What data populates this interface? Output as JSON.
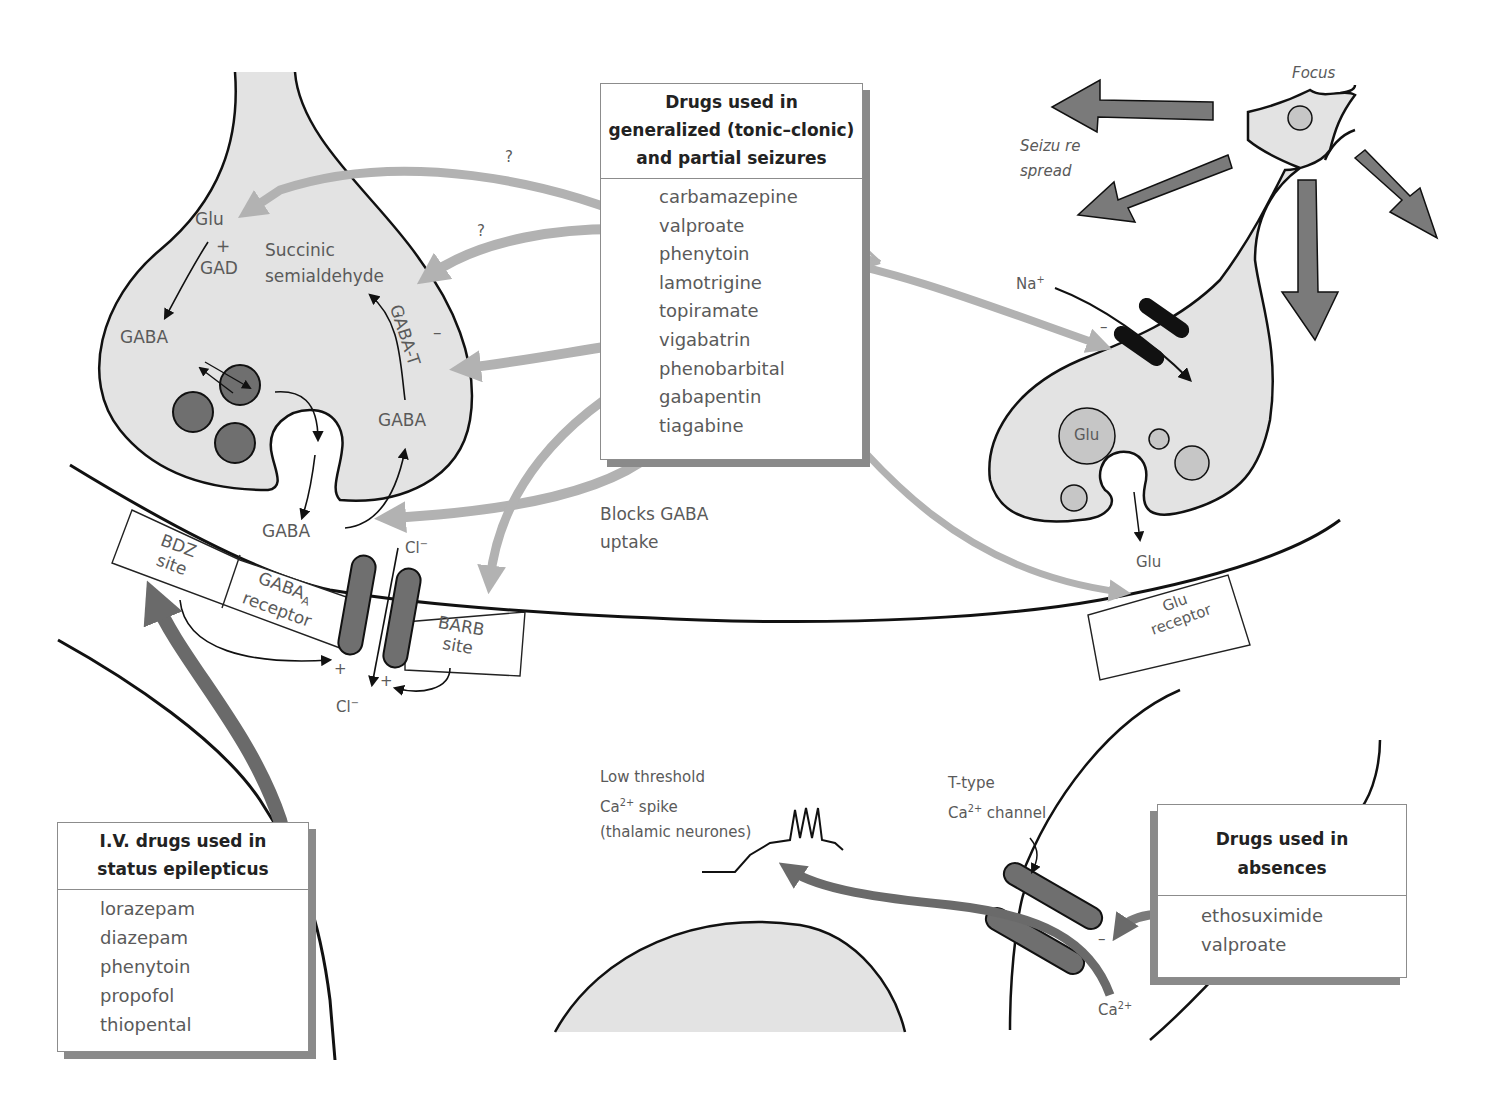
{
  "colors": {
    "cell_fill": "#e3e3e3",
    "vesicle_dark": "#6f6f6f",
    "vesicle_light": "#c6c6c6",
    "drug_arrow_light": "#b2b2b2",
    "spread_arrow": "#7a7a7a",
    "iv_arrow": "#6a6a6a",
    "outline": "#111111",
    "label_text": "#5a5a5a"
  },
  "generalized_box": {
    "title_lines": [
      "Drugs used in",
      "generalized (tonic–clonic)",
      "and partial seizures"
    ],
    "drugs": [
      "carbamazepine",
      "valproate",
      "phenytoin",
      "lamotrigine",
      "topiramate",
      "vigabatrin",
      "phenobarbital",
      "gabapentin",
      "tiagabine"
    ]
  },
  "status_box": {
    "title_lines": [
      "I.V. drugs used in",
      "status epilepticus"
    ],
    "drugs": [
      "lorazepam",
      "diazepam",
      "phenytoin",
      "propofol",
      "thiopental"
    ]
  },
  "absence_box": {
    "title_lines": [
      "Drugs used in",
      "absences"
    ],
    "drugs": [
      "ethosuximide",
      "valproate"
    ]
  },
  "gaba_terminal": {
    "glu": "Glu",
    "plus": "+",
    "gad": "GAD",
    "gaba_left": "GABA",
    "succinic": "Succinic",
    "semialdehyde": "semialdehyde",
    "gaba_t": "GABA-T",
    "minus": "–",
    "gaba_right": "GABA",
    "gaba_cleft": "GABA",
    "question_1": "?",
    "question_2": "?"
  },
  "gaba_receptor": {
    "bdz_line1": "BDZ",
    "bdz_line2": "site",
    "gabaa": "GABA",
    "gabaa_sub": "A",
    "receptor": "receptor",
    "barb_line1": "BARB",
    "barb_line2": "site",
    "cl_top": "Cl",
    "cl_bottom": "Cl",
    "cl_charge": "−",
    "plus": "+"
  },
  "blocks_label": [
    "Blocks GABA",
    "uptake"
  ],
  "glutamate_neuron": {
    "focus": "Focus",
    "seizure_spread": [
      "Seizu re",
      "spread"
    ],
    "na": "Na",
    "na_charge": "+",
    "minus": "–",
    "glu_vesicle": "Glu",
    "glu_cleft": "Glu",
    "glu_receptor_line1": "Glu",
    "glu_receptor_line2": "receptor"
  },
  "thalamic": {
    "spike_label": [
      "Low threshold",
      "Ca",
      "2+",
      " spike",
      "(thalamic neurones)"
    ],
    "channel_label": [
      "T-type",
      "Ca",
      "2+",
      " channel"
    ],
    "ca_ion": "Ca",
    "ca_charge": "2+",
    "minus": "–"
  }
}
